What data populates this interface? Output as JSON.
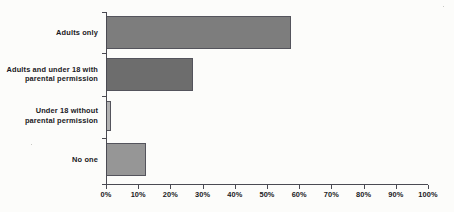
{
  "chart_data": {
    "type": "bar",
    "orientation": "horizontal",
    "title": "",
    "subtitle": "",
    "xlabel": "",
    "ylabel": "",
    "categories": [
      "Adults only",
      "Adults and under 18 with parental permission",
      "Under 18 without parental permission",
      "No one"
    ],
    "values": [
      57.5,
      27.0,
      1.5,
      12.5
    ],
    "value_unit": "%",
    "xlim": [
      0,
      100
    ],
    "xticks": [
      0,
      10,
      20,
      30,
      40,
      50,
      60,
      70,
      80,
      90,
      100
    ],
    "xtick_labels": [
      "0%",
      "10%",
      "20%",
      "30%",
      "40%",
      "50%",
      "60%",
      "70%",
      "80%",
      "90%",
      "100%"
    ],
    "grid": false,
    "legend": null,
    "legend_position": "none",
    "annotations": [],
    "bar_colors": [
      "#7d7d7d",
      "#6d6d6d",
      "#b2b2b2",
      "#969696"
    ],
    "bar_border_color": "#54545c",
    "axis_color": "#4a4a52",
    "text_color": "#191923",
    "background_color": "#fcfcfa"
  },
  "category_label_lines": [
    [
      "Adults only"
    ],
    [
      "Adults and under 18 with",
      "parental permission"
    ],
    [
      "Under 18 without",
      "parental permission"
    ],
    [
      "No one"
    ]
  ]
}
